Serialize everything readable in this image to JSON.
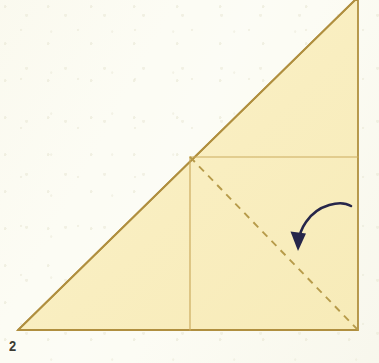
{
  "figure": {
    "kind": "origami-fold-diagram",
    "step_label": "2",
    "canvas": {
      "width": 379,
      "height": 363
    },
    "colors": {
      "background": "#fcfcf4",
      "paper_fill": "#f9eec0",
      "paper_fill_light": "#fbf3cd",
      "outline": "#b08f3f",
      "fold_line": "#cbab5e",
      "dashed_fold_line": "#b79b4a",
      "arrow": "#26264a",
      "step_number": "#3b3b33"
    },
    "shapes": {
      "main_triangle": {
        "name": "right-triangle-paper",
        "points": "18,330 358,330 358,0 355,0"
      },
      "triangle_points_list": [
        {
          "label": "bottom-left-vertex",
          "x": 18,
          "y": 330
        },
        {
          "label": "bottom-right-vertex",
          "x": 358,
          "y": 330
        },
        {
          "label": "top-right-vertex",
          "x": 358,
          "y": 0
        }
      ],
      "horizontal_fold": {
        "name": "horizontal-fold-line",
        "x1": 190,
        "y1": 157,
        "x2": 358,
        "y2": 157
      },
      "vertical_fold": {
        "name": "vertical-fold-line",
        "x1": 190,
        "y1": 157,
        "x2": 190,
        "y2": 330
      },
      "dashed_diagonal": {
        "name": "dashed-diagonal-fold-line",
        "x1": 190,
        "y1": 157,
        "x2": 358,
        "y2": 330
      },
      "arrow": {
        "name": "curved-fold-arrow",
        "path": "M 351 206 C 341 200, 318 204, 306 222 C 301 229, 299 236, 298 243",
        "head_points": "298,250 291,233 305,233",
        "direction": "down-left"
      }
    },
    "annotations": {
      "dash_pattern": "7 6",
      "outline_width": 1.8,
      "fold_line_width": 1.2,
      "arrow_width": 2.6
    }
  }
}
